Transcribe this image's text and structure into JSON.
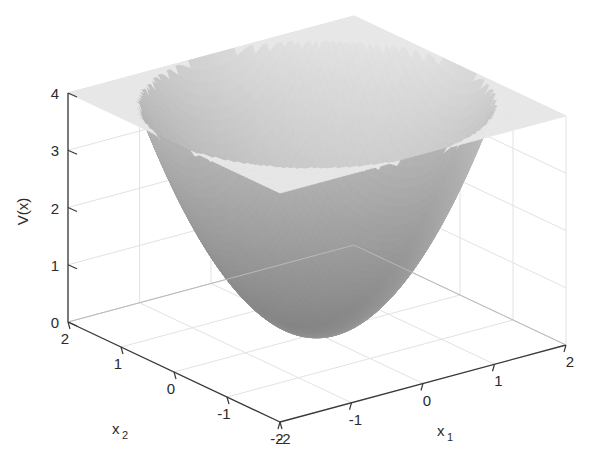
{
  "figure": {
    "type": "surface-plot-3d",
    "background_color": "#ffffff",
    "axis_line_color": "#3a3a3a",
    "grid_color": "#e2e2e2",
    "surface_light": "#f2f2f2",
    "surface_dark": "#7d7d7d"
  },
  "axes": {
    "z": {
      "label": "V(x)",
      "ticks": [
        "0",
        "1",
        "2",
        "3",
        "4"
      ],
      "values": [
        0,
        1,
        2,
        3,
        4
      ],
      "range": [
        0,
        4
      ]
    },
    "x2": {
      "label": "x",
      "sub": "2",
      "ticks": [
        "2",
        "1",
        "0",
        "-1",
        "-2"
      ],
      "values": [
        2,
        1,
        0,
        -1,
        -2
      ],
      "range": [
        -2,
        2
      ]
    },
    "x1": {
      "label": "x",
      "sub": "1",
      "ticks": [
        "-2",
        "-1",
        "0",
        "1",
        "2"
      ],
      "values": [
        -2,
        -1,
        0,
        1,
        2
      ],
      "range": [
        -2,
        2
      ]
    }
  },
  "chart_data": {
    "type": "surface",
    "title": "",
    "xlabel": "x_1",
    "ylabel": "x_2",
    "zlabel": "V(x)",
    "xlim": [
      -2,
      2
    ],
    "ylim": [
      -2,
      2
    ],
    "zlim": [
      0,
      4
    ],
    "xticks": [
      -2,
      -1,
      0,
      1,
      2
    ],
    "yticks": [
      -2,
      -1,
      0,
      1,
      2
    ],
    "zticks": [
      0,
      1,
      2,
      3,
      4
    ],
    "grid": true,
    "legend": null,
    "colormap": "gray",
    "shading": "interp",
    "function": "V(x) = x1^2 + x2^2 (clipped at V = 4)",
    "view": {
      "azimuth": -37.5,
      "elevation": 30
    }
  }
}
